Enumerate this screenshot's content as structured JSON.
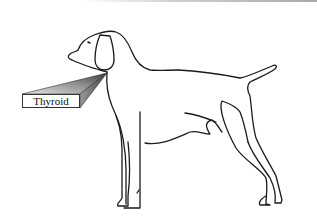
{
  "diagram": {
    "labels": [
      {
        "text": "Thyroid",
        "points_to": "neck"
      }
    ],
    "colors": {
      "outline": "#1a1a1a",
      "pointer_dark": "#555555",
      "pointer_light": "#d8d8d8",
      "background": "#ffffff"
    }
  }
}
